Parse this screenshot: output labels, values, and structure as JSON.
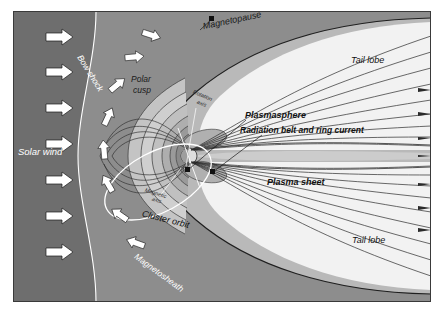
{
  "figure": {
    "kind": "schematic-diagram",
    "background_color": "#ffffff",
    "frame": {
      "x": 13,
      "y": 11,
      "width": 418,
      "height": 291,
      "border_color": "#3a3a3a"
    }
  },
  "regions": {
    "solar_wind_fill": "#6e6e6e",
    "magnetosheath_fill": "#8d8d8d",
    "outer_lobe_fill": "#b9b9b9",
    "inner_shell_fill": "#cfcfcf",
    "tail_lobe_fill": "#f2f2f2",
    "plasma_sheet_fill": "#cccccc",
    "plasmasphere_fill": "#9a9a9a",
    "earth_fill": "#dddddd",
    "field_line_color": "#2b2b2b",
    "boundary_line_color": "#ffffff",
    "arrow_fill": "#ffffff",
    "arrow_stroke": "#1a1a1a"
  },
  "labels": {
    "solar_wind": {
      "text": "Solar wind",
      "x": 18,
      "y": 152,
      "size": 9.5,
      "color": "#ffffff",
      "rotate": 0
    },
    "bow_shock": {
      "text": "Bow shock",
      "x": 79,
      "y": 56,
      "size": 8.5,
      "color": "#ffffff",
      "rotate": 58
    },
    "magnetosheath": {
      "text": "Magnetosheath",
      "x": 135,
      "y": 256,
      "size": 8.5,
      "color": "#ffffff",
      "rotate": 36
    },
    "magnetopause": {
      "text": "Magnetopause",
      "x": 203,
      "y": 27,
      "size": 9,
      "color": "#1a1a1a",
      "rotate": -12
    },
    "polar_cusp_line1": {
      "text": "Polar",
      "x": 131,
      "y": 80,
      "size": 8.5,
      "color": "#1a1a1a",
      "rotate": 0
    },
    "polar_cusp_line2": {
      "text": "cusp",
      "x": 133,
      "y": 91,
      "size": 8.5,
      "color": "#1a1a1a",
      "rotate": 0
    },
    "rotation_axis_line1": {
      "text": "Rotation",
      "x": 193,
      "y": 92,
      "size": 5.5,
      "color": "#2a2a2a",
      "rotate": 22
    },
    "rotation_axis_line2": {
      "text": "axis",
      "x": 197,
      "y": 102,
      "size": 5.5,
      "color": "#2a2a2a",
      "rotate": 22
    },
    "magnetic_axis_line1": {
      "text": "Magnetic",
      "x": 145,
      "y": 190,
      "size": 5.5,
      "color": "#2a2a2a",
      "rotate": 18
    },
    "magnetic_axis_line2": {
      "text": "axis",
      "x": 152,
      "y": 199,
      "size": 5.5,
      "color": "#2a2a2a",
      "rotate": 18
    },
    "plasmasphere": {
      "text": "Plasmasphere",
      "x": 245,
      "y": 116,
      "size": 9,
      "color": "#111111",
      "rotate": 0
    },
    "radiation_belt": {
      "text": "Radiation belt and ring current",
      "x": 240,
      "y": 131,
      "size": 8.5,
      "color": "#111111",
      "rotate": 0
    },
    "plasma_sheet": {
      "text": "Plasma sheet",
      "x": 267,
      "y": 183,
      "size": 9,
      "color": "#111111",
      "rotate": 0
    },
    "tail_lobe_upper": {
      "text": "Tail lobe",
      "x": 351,
      "y": 61,
      "size": 9,
      "color": "#111111",
      "rotate": 0
    },
    "tail_lobe_lower": {
      "text": "Tail lobe",
      "x": 352,
      "y": 241,
      "size": 9,
      "color": "#111111",
      "rotate": 0
    },
    "cluster_orbit": {
      "text": "Cluster orbit",
      "x": 142,
      "y": 214,
      "size": 9,
      "color": "#111111",
      "rotate": 14
    }
  },
  "solar_wind_arrows": [
    {
      "x": 60,
      "y": 37
    },
    {
      "x": 60,
      "y": 72
    },
    {
      "x": 60,
      "y": 108
    },
    {
      "x": 60,
      "y": 144
    },
    {
      "x": 60,
      "y": 180
    },
    {
      "x": 60,
      "y": 216
    },
    {
      "x": 60,
      "y": 252
    }
  ],
  "sheath_flow_arrows": [
    {
      "x": 151,
      "y": 35,
      "rotate": 18
    },
    {
      "x": 134,
      "y": 57,
      "rotate": 0
    },
    {
      "x": 117,
      "y": 85,
      "rotate": -20
    },
    {
      "x": 108,
      "y": 117,
      "rotate": -40
    },
    {
      "x": 104,
      "y": 148,
      "rotate": -62
    },
    {
      "x": 106,
      "y": 180,
      "rotate": -85
    },
    {
      "x": 115,
      "y": 210,
      "rotate": -110
    },
    {
      "x": 131,
      "y": 240,
      "rotate": -130
    }
  ],
  "earth": {
    "cx": 189,
    "cy": 156,
    "r": 8
  },
  "leader_dots": [
    {
      "x": 212,
      "y": 19
    },
    {
      "x": 187,
      "y": 170
    },
    {
      "x": 212,
      "y": 172
    }
  ],
  "tail_arrow_rows": [
    88,
    112,
    137,
    160,
    183,
    206,
    228
  ]
}
